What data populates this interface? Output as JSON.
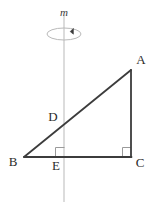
{
  "figure": {
    "background_color": "#ffffff",
    "width": 161,
    "height": 207,
    "stroke_color": "#3c3c3c",
    "axis_color": "#b9b9b9",
    "label_color": "#2b2b2b"
  },
  "axis": {
    "name": "axis-of-rotation",
    "label": "m",
    "x": 64,
    "y_top": 15,
    "y_bottom": 202,
    "color": "#b9b9b9",
    "label_x": 64,
    "label_y": 13
  },
  "rotation_ellipse": {
    "name": "rotation-indicator",
    "center_x": 64,
    "center_y": 34,
    "radius_x": 17,
    "radius_y": 6,
    "color": "#b9b9b9",
    "arrow_color": "#3c3c3c",
    "arrow_x": 72,
    "arrow_y": 31
  },
  "triangle": {
    "name": "triangle-ABC",
    "stroke_color": "#3c3c3c",
    "stroke_width": 1.6,
    "points": "24,157 131,157 131,70"
  },
  "vertices": [
    {
      "id": "A",
      "label": "A",
      "x": 131,
      "y": 70,
      "label_x": 141,
      "label_y": 61
    },
    {
      "id": "B",
      "label": "B",
      "x": 24,
      "y": 157,
      "label_x": 13,
      "label_y": 163
    },
    {
      "id": "C",
      "label": "C",
      "x": 131,
      "y": 157,
      "label_x": 140,
      "label_y": 164
    },
    {
      "id": "D",
      "label": "D",
      "x": 64,
      "y": 126,
      "label_x": 53,
      "label_y": 118
    },
    {
      "id": "E",
      "label": "E",
      "x": 64,
      "y": 157,
      "label_x": 56,
      "label_y": 167
    }
  ],
  "right_angles": [
    {
      "id": "angle-at-E",
      "x": 55,
      "y": 146,
      "size": 9,
      "color": "#9a9a9a"
    },
    {
      "id": "angle-at-C",
      "x": 122,
      "y": 146,
      "size": 9,
      "color": "#9a9a9a"
    }
  ],
  "segments": [
    {
      "id": "segment-BC",
      "from": "B",
      "to": "C"
    },
    {
      "id": "segment-CA",
      "from": "C",
      "to": "A"
    },
    {
      "id": "segment-AB",
      "from": "A",
      "to": "B"
    },
    {
      "id": "segment-DE",
      "from": "D",
      "to": "E"
    }
  ]
}
